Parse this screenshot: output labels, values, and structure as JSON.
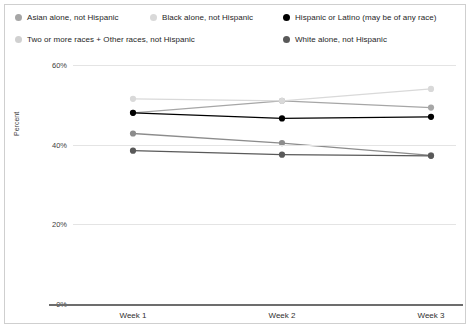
{
  "legend": {
    "items": [
      {
        "label": "Asian alone, not Hispanic",
        "color": "#a6a6a6",
        "pos": "lg-r1 lg-c1"
      },
      {
        "label": "Black alone, not Hispanic",
        "color": "#d9d9d9",
        "pos": "lg-r1 lg-c2"
      },
      {
        "label": "Hispanic or Latino (may be of any race)",
        "color": "#000000",
        "pos": "lg-r1 lg-c3"
      },
      {
        "label": "Two or more races + Other races, not Hispanic",
        "color": "#d0d0d0",
        "pos": "lg-r2 lg-c1"
      },
      {
        "label": "White alone, not Hispanic",
        "color": "#595959",
        "pos": "lg-r2 lg-c3"
      }
    ]
  },
  "axis": {
    "y_title": "Percent",
    "y_ticks": [
      "60%",
      "40%",
      "20%",
      "0%"
    ],
    "x_ticks": [
      "Week 1",
      "Week 2",
      "Week 3"
    ]
  },
  "chart_data": {
    "type": "line",
    "title": "",
    "xlabel": "",
    "ylabel": "Percent",
    "categories": [
      "Week 1",
      "Week 2",
      "Week 3"
    ],
    "ylim": [
      0,
      60
    ],
    "ytick_values": [
      0,
      20,
      40,
      60
    ],
    "grid": true,
    "legend_position": "top",
    "series": [
      {
        "name": "Asian alone, not Hispanic",
        "color": "#a6a6a6",
        "values": [
          48.0,
          51.0,
          49.3
        ]
      },
      {
        "name": "Black alone, not Hispanic",
        "color": "#d9d9d9",
        "values": [
          51.5,
          51.0,
          54.0
        ]
      },
      {
        "name": "Hispanic or Latino (may be of any race)",
        "color": "#000000",
        "values": [
          48.0,
          46.6,
          47.0
        ]
      },
      {
        "name": "Two or more races + Other races, not Hispanic",
        "color": "#8c8c8c",
        "values": [
          42.8,
          40.4,
          37.3
        ]
      },
      {
        "name": "White alone, not Hispanic",
        "color": "#595959",
        "values": [
          38.5,
          37.5,
          37.2
        ]
      }
    ]
  }
}
